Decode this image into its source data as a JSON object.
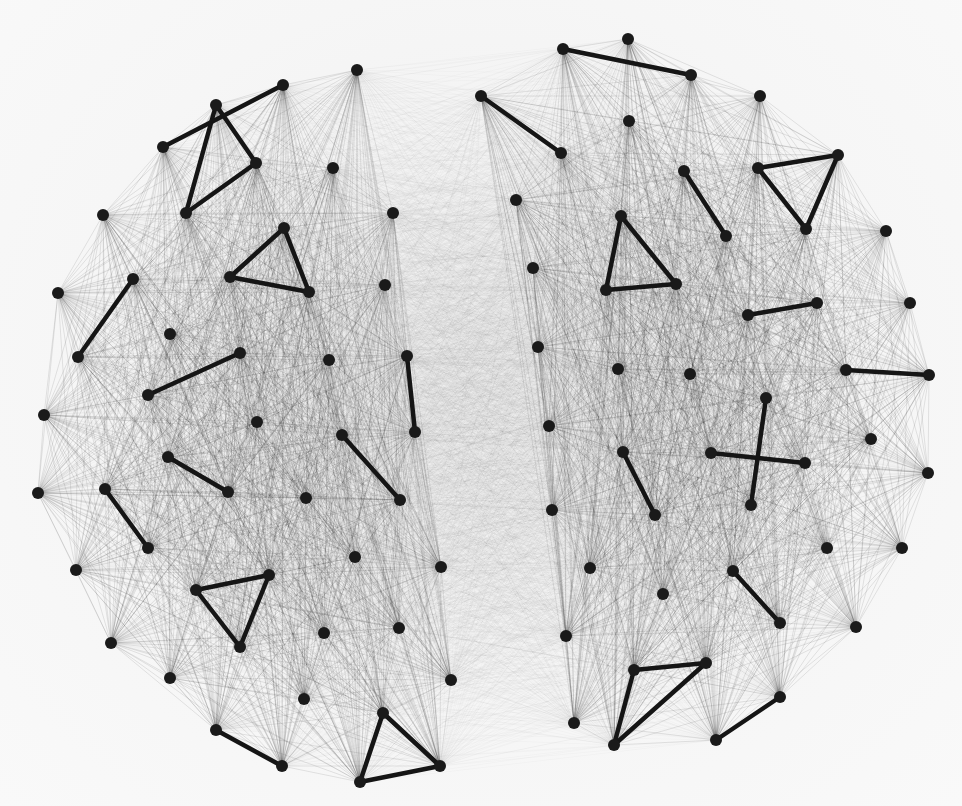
{
  "figure": {
    "type": "network-graph",
    "background_color": "#f5f5f5",
    "node_color": "#1a1a1a",
    "edge_color": "#000000",
    "highlight_edge_color": "#151515",
    "node_radius": 6,
    "clusters": [
      {
        "name": "left-cluster",
        "intra_edge_alpha": 0.16,
        "nodes": [
          [
            357,
            70
          ],
          [
            283,
            85
          ],
          [
            216,
            105
          ],
          [
            163,
            147
          ],
          [
            256,
            163
          ],
          [
            186,
            213
          ],
          [
            103,
            215
          ],
          [
            333,
            168
          ],
          [
            393,
            213
          ],
          [
            284,
            228
          ],
          [
            309,
            292
          ],
          [
            230,
            277
          ],
          [
            385,
            285
          ],
          [
            133,
            279
          ],
          [
            58,
            293
          ],
          [
            78,
            357
          ],
          [
            170,
            334
          ],
          [
            240,
            353
          ],
          [
            148,
            395
          ],
          [
            329,
            360
          ],
          [
            407,
            356
          ],
          [
            44,
            415
          ],
          [
            257,
            422
          ],
          [
            342,
            435
          ],
          [
            415,
            432
          ],
          [
            168,
            457
          ],
          [
            228,
            492
          ],
          [
            306,
            498
          ],
          [
            400,
            500
          ],
          [
            38,
            493
          ],
          [
            105,
            489
          ],
          [
            148,
            548
          ],
          [
            76,
            570
          ],
          [
            196,
            590
          ],
          [
            269,
            575
          ],
          [
            355,
            557
          ],
          [
            441,
            567
          ],
          [
            240,
            647
          ],
          [
            111,
            643
          ],
          [
            324,
            633
          ],
          [
            399,
            628
          ],
          [
            170,
            678
          ],
          [
            304,
            699
          ],
          [
            451,
            680
          ],
          [
            216,
            730
          ],
          [
            282,
            766
          ],
          [
            383,
            713
          ],
          [
            360,
            782
          ],
          [
            440,
            766
          ]
        ],
        "highlight_edges": [
          [
            [
              163,
              147
            ],
            [
              283,
              85
            ]
          ],
          [
            [
              216,
              105
            ],
            [
              256,
              163
            ]
          ],
          [
            [
              216,
              105
            ],
            [
              186,
              213
            ]
          ],
          [
            [
              186,
              213
            ],
            [
              256,
              163
            ]
          ],
          [
            [
              284,
              228
            ],
            [
              230,
              277
            ]
          ],
          [
            [
              284,
              228
            ],
            [
              309,
              292
            ]
          ],
          [
            [
              230,
              277
            ],
            [
              309,
              292
            ]
          ],
          [
            [
              133,
              279
            ],
            [
              78,
              357
            ]
          ],
          [
            [
              148,
              395
            ],
            [
              240,
              353
            ]
          ],
          [
            [
              407,
              356
            ],
            [
              415,
              432
            ]
          ],
          [
            [
              342,
              435
            ],
            [
              400,
              500
            ]
          ],
          [
            [
              168,
              457
            ],
            [
              228,
              492
            ]
          ],
          [
            [
              105,
              489
            ],
            [
              148,
              548
            ]
          ],
          [
            [
              196,
              590
            ],
            [
              269,
              575
            ]
          ],
          [
            [
              196,
              590
            ],
            [
              240,
              647
            ]
          ],
          [
            [
              240,
              647
            ],
            [
              269,
              575
            ]
          ],
          [
            [
              216,
              730
            ],
            [
              282,
              766
            ]
          ],
          [
            [
              383,
              713
            ],
            [
              360,
              782
            ]
          ],
          [
            [
              383,
              713
            ],
            [
              440,
              766
            ]
          ],
          [
            [
              360,
              782
            ],
            [
              440,
              766
            ]
          ]
        ]
      },
      {
        "name": "right-cluster",
        "intra_edge_alpha": 0.16,
        "nodes": [
          [
            628,
            39
          ],
          [
            563,
            49
          ],
          [
            691,
            75
          ],
          [
            760,
            96
          ],
          [
            481,
            96
          ],
          [
            629,
            121
          ],
          [
            561,
            153
          ],
          [
            516,
            200
          ],
          [
            684,
            171
          ],
          [
            758,
            168
          ],
          [
            838,
            155
          ],
          [
            806,
            229
          ],
          [
            621,
            216
          ],
          [
            726,
            236
          ],
          [
            886,
            231
          ],
          [
            533,
            268
          ],
          [
            606,
            290
          ],
          [
            676,
            284
          ],
          [
            817,
            303
          ],
          [
            748,
            315
          ],
          [
            910,
            303
          ],
          [
            538,
            347
          ],
          [
            618,
            369
          ],
          [
            690,
            374
          ],
          [
            846,
            370
          ],
          [
            929,
            375
          ],
          [
            766,
            398
          ],
          [
            549,
            426
          ],
          [
            623,
            452
          ],
          [
            711,
            453
          ],
          [
            805,
            463
          ],
          [
            871,
            439
          ],
          [
            928,
            473
          ],
          [
            552,
            510
          ],
          [
            655,
            515
          ],
          [
            751,
            505
          ],
          [
            827,
            548
          ],
          [
            902,
            548
          ],
          [
            590,
            568
          ],
          [
            663,
            594
          ],
          [
            733,
            571
          ],
          [
            780,
            623
          ],
          [
            856,
            627
          ],
          [
            566,
            636
          ],
          [
            634,
            670
          ],
          [
            706,
            663
          ],
          [
            780,
            697
          ],
          [
            574,
            723
          ],
          [
            614,
            745
          ],
          [
            716,
            740
          ]
        ],
        "highlight_edges": [
          [
            [
              563,
              49
            ],
            [
              691,
              75
            ]
          ],
          [
            [
              481,
              96
            ],
            [
              561,
              153
            ]
          ],
          [
            [
              684,
              171
            ],
            [
              726,
              236
            ]
          ],
          [
            [
              758,
              168
            ],
            [
              838,
              155
            ]
          ],
          [
            [
              758,
              168
            ],
            [
              806,
              229
            ]
          ],
          [
            [
              838,
              155
            ],
            [
              806,
              229
            ]
          ],
          [
            [
              621,
              216
            ],
            [
              606,
              290
            ]
          ],
          [
            [
              621,
              216
            ],
            [
              676,
              284
            ]
          ],
          [
            [
              606,
              290
            ],
            [
              676,
              284
            ]
          ],
          [
            [
              748,
              315
            ],
            [
              817,
              303
            ]
          ],
          [
            [
              846,
              370
            ],
            [
              929,
              375
            ]
          ],
          [
            [
              711,
              453
            ],
            [
              805,
              463
            ]
          ],
          [
            [
              766,
              398
            ],
            [
              751,
              505
            ]
          ],
          [
            [
              623,
              452
            ],
            [
              655,
              515
            ]
          ],
          [
            [
              733,
              571
            ],
            [
              780,
              623
            ]
          ],
          [
            [
              634,
              670
            ],
            [
              706,
              663
            ]
          ],
          [
            [
              634,
              670
            ],
            [
              614,
              745
            ]
          ],
          [
            [
              614,
              745
            ],
            [
              706,
              663
            ]
          ],
          [
            [
              716,
              740
            ],
            [
              780,
              697
            ]
          ]
        ]
      }
    ],
    "inter_cluster_edge_alpha": 0.045,
    "inter_cluster_sample_step": 1
  }
}
